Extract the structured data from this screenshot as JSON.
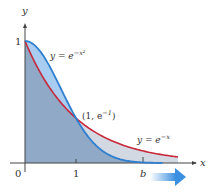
{
  "diagram": {
    "axes": {
      "x_label": "x",
      "y_label": "y",
      "origin_label": "0",
      "x_tick_1": "1",
      "x_tick_b": "b",
      "y_tick_1": "1"
    },
    "curves": [
      {
        "name": "gaussian",
        "equation_lhs": "y = e",
        "equation_exp": "−x²",
        "color": "#2f7fd1"
      },
      {
        "name": "exponential",
        "equation_lhs": "y = e",
        "equation_exp": "−x",
        "color": "#c8283c"
      }
    ],
    "intersection": {
      "label_pre": "(1, e",
      "label_exp": "−1",
      "label_post": ")"
    },
    "colors": {
      "region_under_gaussian": "#8fb1d6",
      "region_between": "#cfd8e4",
      "region_light_blue": "#a9cdf0",
      "axis": "#444444",
      "arrow": "#3b8fe0"
    },
    "scale": {
      "x_origin_px": 25,
      "y_origin_px": 163,
      "x_unit_px": 51,
      "y_unit_px": 122,
      "b_value": 2.3,
      "x_max": 3.0
    }
  }
}
